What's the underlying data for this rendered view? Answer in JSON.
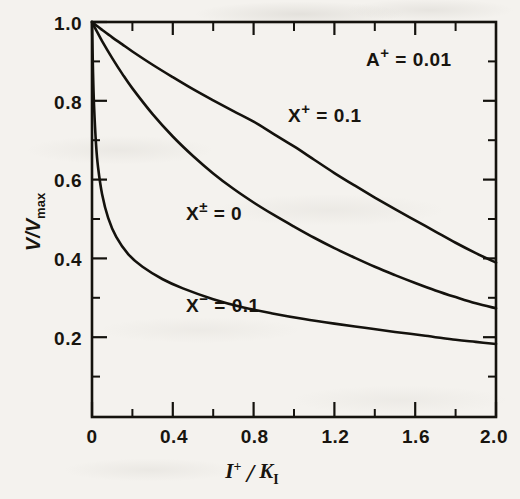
{
  "figure": {
    "background_color": "#f4f2ee",
    "ink_color": "#14120d"
  },
  "chart_data": {
    "type": "line",
    "title": "",
    "subtitle": "",
    "xlabel": "I+ / K_I",
    "xlabel_parts": {
      "num_base": "I",
      "num_sup": "+",
      "slash": "/",
      "den_base": "K",
      "den_sub": "I"
    },
    "ylabel": "V/Vmax",
    "ylabel_parts": {
      "first": "V/V",
      "sub": "max"
    },
    "xlim": [
      0,
      2.0
    ],
    "ylim": [
      0.048,
      1.0
    ],
    "grid": false,
    "legend": "none (inline curve annotations)",
    "xticks": [
      0,
      0.4,
      0.8,
      1.2,
      1.6,
      2.0
    ],
    "xtick_labels": [
      "0",
      "0.4",
      "0.8",
      "1.2",
      "1.6",
      "2.0"
    ],
    "xminor_step": 0.2,
    "yticks": [
      0.2,
      0.4,
      0.6,
      0.8,
      1.0
    ],
    "ytick_labels": [
      "0.2",
      "0.4",
      "0.6",
      "0.8",
      "1.0"
    ],
    "yminor_step": 0.1,
    "parameters": [
      {
        "id": "A_plus",
        "base": "A",
        "sup": "+",
        "eq": "=",
        "value": "0.01",
        "text": "A+ = 0.01"
      }
    ],
    "series": [
      {
        "name": "X+ = 0.1",
        "label_base": "X",
        "label_sup": "+",
        "label_eq": "=",
        "label_value": "0.1",
        "x": [
          0,
          0.02,
          0.05,
          0.1,
          0.15,
          0.2,
          0.3,
          0.4,
          0.5,
          0.6,
          0.7,
          0.8,
          0.9,
          1.0,
          1.1,
          1.2,
          1.3,
          1.4,
          1.5,
          1.6,
          1.7,
          1.8,
          1.9,
          2.0
        ],
        "values": [
          1.0,
          0.992,
          0.981,
          0.963,
          0.946,
          0.929,
          0.897,
          0.867,
          0.838,
          0.811,
          0.785,
          0.76,
          0.73,
          0.7,
          0.668,
          0.636,
          0.606,
          0.577,
          0.549,
          0.522,
          0.495,
          0.468,
          0.443,
          0.42
        ]
      },
      {
        "name": "X± = 0",
        "label_base": "X",
        "label_sup": "±",
        "label_eq": "=",
        "label_value": "0",
        "x": [
          0,
          0.02,
          0.05,
          0.1,
          0.15,
          0.2,
          0.3,
          0.4,
          0.5,
          0.6,
          0.7,
          0.8,
          0.9,
          1.0,
          1.1,
          1.2,
          1.3,
          1.4,
          1.5,
          1.6,
          1.7,
          1.8,
          1.9,
          2.0
        ],
        "values": [
          1.0,
          0.981,
          0.954,
          0.913,
          0.875,
          0.84,
          0.778,
          0.724,
          0.677,
          0.635,
          0.598,
          0.565,
          0.535,
          0.507,
          0.48,
          0.455,
          0.432,
          0.41,
          0.39,
          0.371,
          0.353,
          0.337,
          0.322,
          0.31
        ]
      },
      {
        "name": "X- = 0.1",
        "label_base": "X",
        "label_sup": "−",
        "label_eq": "=",
        "label_value": "0.1",
        "x": [
          0,
          0.005,
          0.01,
          0.02,
          0.03,
          0.05,
          0.08,
          0.12,
          0.18,
          0.25,
          0.35,
          0.45,
          0.6,
          0.75,
          0.9,
          1.05,
          1.2,
          1.35,
          1.5,
          1.65,
          1.8,
          1.9,
          2.0
        ],
        "values": [
          1.0,
          0.88,
          0.8,
          0.705,
          0.65,
          0.585,
          0.528,
          0.482,
          0.44,
          0.41,
          0.38,
          0.358,
          0.332,
          0.312,
          0.297,
          0.284,
          0.273,
          0.263,
          0.253,
          0.244,
          0.234,
          0.229,
          0.224
        ]
      }
    ]
  }
}
